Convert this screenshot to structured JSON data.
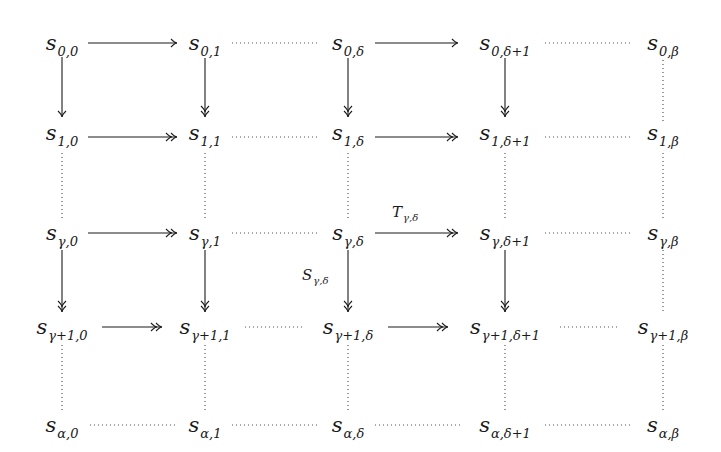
{
  "diagram": {
    "type": "commutative-grid",
    "columns": [
      {
        "key": "0",
        "x": 62
      },
      {
        "key": "1",
        "x": 205
      },
      {
        "key": "δ",
        "x": 348
      },
      {
        "key": "δ+1",
        "x": 505
      },
      {
        "key": "β",
        "x": 663
      }
    ],
    "rows": [
      {
        "key": "0",
        "y": 43
      },
      {
        "key": "1",
        "y": 133
      },
      {
        "key": "γ",
        "y": 233
      },
      {
        "key": "γ+1",
        "y": 327
      },
      {
        "key": "α",
        "y": 425
      }
    ],
    "nodes": [
      {
        "id": "n00",
        "base": "s",
        "sub": "0,0",
        "x": 62,
        "y": 43
      },
      {
        "id": "n01",
        "base": "s",
        "sub": "0,1",
        "x": 205,
        "y": 43
      },
      {
        "id": "n0d",
        "base": "s",
        "sub": "0,δ",
        "x": 348,
        "y": 43
      },
      {
        "id": "n0d1",
        "base": "s",
        "sub": "0,δ+1",
        "x": 505,
        "y": 43
      },
      {
        "id": "n0b",
        "base": "s",
        "sub": "0,β",
        "x": 663,
        "y": 43
      },
      {
        "id": "n10",
        "base": "s",
        "sub": "1,0",
        "x": 62,
        "y": 133
      },
      {
        "id": "n11",
        "base": "s",
        "sub": "1,1",
        "x": 205,
        "y": 133
      },
      {
        "id": "n1d",
        "base": "s",
        "sub": "1,δ",
        "x": 348,
        "y": 133
      },
      {
        "id": "n1d1",
        "base": "s",
        "sub": "1,δ+1",
        "x": 505,
        "y": 133
      },
      {
        "id": "n1b",
        "base": "s",
        "sub": "1,β",
        "x": 663,
        "y": 133
      },
      {
        "id": "ng0",
        "base": "s",
        "sub": "γ,0",
        "x": 62,
        "y": 233
      },
      {
        "id": "ng1",
        "base": "s",
        "sub": "γ,1",
        "x": 205,
        "y": 233
      },
      {
        "id": "ngd",
        "base": "s",
        "sub": "γ,δ",
        "x": 348,
        "y": 233
      },
      {
        "id": "ngd1",
        "base": "s",
        "sub": "γ,δ+1",
        "x": 505,
        "y": 233
      },
      {
        "id": "ngb",
        "base": "s",
        "sub": "γ,β",
        "x": 663,
        "y": 233
      },
      {
        "id": "ng10",
        "base": "s",
        "sub": "γ+1,0",
        "x": 62,
        "y": 327
      },
      {
        "id": "ng11",
        "base": "s",
        "sub": "γ+1,1",
        "x": 205,
        "y": 327
      },
      {
        "id": "ng1d",
        "base": "s",
        "sub": "γ+1,δ",
        "x": 348,
        "y": 327
      },
      {
        "id": "ng1d1",
        "base": "s",
        "sub": "γ+1,δ+1",
        "x": 505,
        "y": 327
      },
      {
        "id": "ng1b",
        "base": "s",
        "sub": "γ+1,β",
        "x": 663,
        "y": 327
      },
      {
        "id": "na0",
        "base": "s",
        "sub": "α,0",
        "x": 62,
        "y": 425
      },
      {
        "id": "na1",
        "base": "s",
        "sub": "α,1",
        "x": 205,
        "y": 425
      },
      {
        "id": "nad",
        "base": "s",
        "sub": "α,δ",
        "x": 348,
        "y": 425
      },
      {
        "id": "nad1",
        "base": "s",
        "sub": "α,δ+1",
        "x": 505,
        "y": 425
      },
      {
        "id": "nab",
        "base": "s",
        "sub": "α,β",
        "x": 663,
        "y": 425
      }
    ],
    "edges": [
      {
        "from": "n00",
        "to": "n01",
        "style": "arrow",
        "x1": 88,
        "y1": 43,
        "x2": 177,
        "y2": 43
      },
      {
        "from": "n01",
        "to": "n0d",
        "style": "dotted",
        "x1": 232,
        "y1": 43,
        "x2": 320,
        "y2": 43
      },
      {
        "from": "n0d",
        "to": "n0d1",
        "style": "arrow",
        "x1": 375,
        "y1": 43,
        "x2": 458,
        "y2": 43
      },
      {
        "from": "n0d1",
        "to": "n0b",
        "style": "dotted",
        "x1": 545,
        "y1": 43,
        "x2": 632,
        "y2": 43
      },
      {
        "from": "n10",
        "to": "n11",
        "style": "epi",
        "x1": 88,
        "y1": 137,
        "x2": 177,
        "y2": 137
      },
      {
        "from": "n11",
        "to": "n1d",
        "style": "dotted",
        "x1": 232,
        "y1": 137,
        "x2": 320,
        "y2": 137
      },
      {
        "from": "n1d",
        "to": "n1d1",
        "style": "epi",
        "x1": 375,
        "y1": 137,
        "x2": 458,
        "y2": 137
      },
      {
        "from": "n1d1",
        "to": "n1b",
        "style": "dotted",
        "x1": 545,
        "y1": 137,
        "x2": 632,
        "y2": 137
      },
      {
        "from": "ng0",
        "to": "ng1",
        "style": "epi",
        "x1": 88,
        "y1": 233,
        "x2": 177,
        "y2": 233
      },
      {
        "from": "ng1",
        "to": "ngd",
        "style": "dotted",
        "x1": 232,
        "y1": 233,
        "x2": 320,
        "y2": 233
      },
      {
        "from": "ngd",
        "to": "ngd1",
        "style": "epi",
        "x1": 375,
        "y1": 233,
        "x2": 458,
        "y2": 233,
        "label": "T",
        "label_sub": "γ,δ"
      },
      {
        "from": "ngd1",
        "to": "ngb",
        "style": "dotted",
        "x1": 545,
        "y1": 233,
        "x2": 632,
        "y2": 233
      },
      {
        "from": "ng10",
        "to": "ng11",
        "style": "epi",
        "x1": 102,
        "y1": 327,
        "x2": 162,
        "y2": 327
      },
      {
        "from": "ng11",
        "to": "ng1d",
        "style": "dotted",
        "x1": 245,
        "y1": 327,
        "x2": 305,
        "y2": 327
      },
      {
        "from": "ng1d",
        "to": "ng1d1",
        "style": "epi",
        "x1": 388,
        "y1": 327,
        "x2": 448,
        "y2": 327
      },
      {
        "from": "ng1d1",
        "to": "ng1b",
        "style": "dotted",
        "x1": 560,
        "y1": 327,
        "x2": 620,
        "y2": 327
      },
      {
        "from": "na0",
        "to": "na1",
        "style": "dotted",
        "x1": 90,
        "y1": 425,
        "x2": 175,
        "y2": 425
      },
      {
        "from": "na1",
        "to": "nad",
        "style": "dotted",
        "x1": 232,
        "y1": 425,
        "x2": 318,
        "y2": 425
      },
      {
        "from": "nad",
        "to": "nad1",
        "style": "dotted",
        "x1": 375,
        "y1": 425,
        "x2": 460,
        "y2": 425
      },
      {
        "from": "nad1",
        "to": "nab",
        "style": "dotted",
        "x1": 545,
        "y1": 425,
        "x2": 632,
        "y2": 425
      },
      {
        "from": "n00",
        "to": "n10",
        "style": "arrow",
        "x1": 62,
        "y1": 57,
        "x2": 62,
        "y2": 117
      },
      {
        "from": "n01",
        "to": "n11",
        "style": "epi",
        "x1": 205,
        "y1": 58,
        "x2": 205,
        "y2": 117
      },
      {
        "from": "n0d",
        "to": "n1d",
        "style": "epi",
        "x1": 348,
        "y1": 58,
        "x2": 348,
        "y2": 117
      },
      {
        "from": "n0d1",
        "to": "n1d1",
        "style": "epi",
        "x1": 505,
        "y1": 58,
        "x2": 505,
        "y2": 117
      },
      {
        "from": "n0b",
        "to": "n1b",
        "style": "dotted",
        "x1": 663,
        "y1": 60,
        "x2": 663,
        "y2": 123
      },
      {
        "from": "n10",
        "to": "ng0",
        "style": "dotted",
        "x1": 62,
        "y1": 153,
        "x2": 62,
        "y2": 218
      },
      {
        "from": "n11",
        "to": "ng1",
        "style": "dotted",
        "x1": 205,
        "y1": 153,
        "x2": 205,
        "y2": 218
      },
      {
        "from": "n1d",
        "to": "ngd",
        "style": "dotted",
        "x1": 348,
        "y1": 153,
        "x2": 348,
        "y2": 218
      },
      {
        "from": "n1d1",
        "to": "ngd1",
        "style": "dotted",
        "x1": 505,
        "y1": 153,
        "x2": 505,
        "y2": 218
      },
      {
        "from": "n1b",
        "to": "ngb",
        "style": "dotted",
        "x1": 663,
        "y1": 153,
        "x2": 663,
        "y2": 218
      },
      {
        "from": "ng0",
        "to": "ng10",
        "style": "epi",
        "x1": 62,
        "y1": 250,
        "x2": 62,
        "y2": 312
      },
      {
        "from": "ng1",
        "to": "ng11",
        "style": "epi",
        "x1": 205,
        "y1": 250,
        "x2": 205,
        "y2": 312
      },
      {
        "from": "ngd",
        "to": "ng1d",
        "style": "epi",
        "x1": 348,
        "y1": 250,
        "x2": 348,
        "y2": 312,
        "label": "S",
        "label_sub": "γ,δ"
      },
      {
        "from": "ngd1",
        "to": "ng1d1",
        "style": "epi",
        "x1": 505,
        "y1": 250,
        "x2": 505,
        "y2": 312
      },
      {
        "from": "ngb",
        "to": "ng1b",
        "style": "dotted",
        "x1": 663,
        "y1": 250,
        "x2": 663,
        "y2": 312
      },
      {
        "from": "ng10",
        "to": "na0",
        "style": "dotted",
        "x1": 62,
        "y1": 345,
        "x2": 62,
        "y2": 410
      },
      {
        "from": "ng11",
        "to": "na1",
        "style": "dotted",
        "x1": 205,
        "y1": 345,
        "x2": 205,
        "y2": 410
      },
      {
        "from": "ng1d",
        "to": "nad",
        "style": "dotted",
        "x1": 348,
        "y1": 345,
        "x2": 348,
        "y2": 410
      },
      {
        "from": "ng1d1",
        "to": "nad1",
        "style": "dotted",
        "x1": 505,
        "y1": 345,
        "x2": 505,
        "y2": 410
      },
      {
        "from": "ng1b",
        "to": "nab",
        "style": "dotted",
        "x1": 663,
        "y1": 345,
        "x2": 663,
        "y2": 410
      }
    ],
    "edge_labels": [
      {
        "id": "T",
        "base": "T",
        "sub": "γ,δ",
        "x": 392,
        "y": 205
      },
      {
        "id": "S",
        "base": "S",
        "sub": "γ,δ",
        "x": 302,
        "y": 268
      }
    ],
    "colors": {
      "ink": "#1a1a1a",
      "dots": "#555555",
      "background": "#ffffff"
    }
  }
}
